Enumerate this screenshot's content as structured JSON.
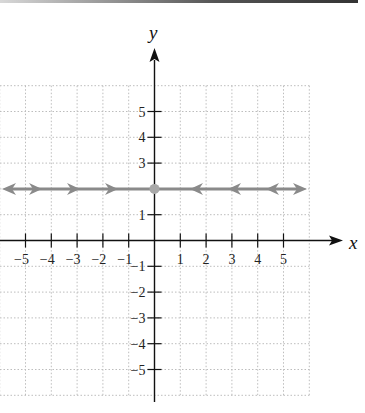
{
  "chart_data": {
    "type": "line",
    "title": "",
    "xlabel": "x",
    "ylabel": "y",
    "xlim": [
      -6,
      6
    ],
    "ylim": [
      -6,
      6
    ],
    "grid": true,
    "x_tick_labels": [
      "−5",
      "−4",
      "−3",
      "−2",
      "−1",
      "1",
      "2",
      "3",
      "4",
      "5"
    ],
    "x_ticks": [
      -5,
      -4,
      -3,
      -2,
      -1,
      1,
      2,
      3,
      4,
      5
    ],
    "y_tick_labels": [
      "5",
      "4",
      "3",
      "1",
      "−1",
      "−2",
      "−3",
      "−4",
      "−5"
    ],
    "y_ticks": [
      5,
      4,
      3,
      1,
      -1,
      -2,
      -3,
      -4,
      -5
    ],
    "series": [
      {
        "name": "y = 2",
        "equation": "y = 2",
        "kind": "horizontal line",
        "y": 2,
        "x": [
          -6,
          6
        ],
        "color": "#8a8a8a",
        "direction_arrows": "pointing toward (0, 2) from both sides",
        "end_arrows": "both ends"
      }
    ],
    "points": [
      {
        "x": 0,
        "y": 2,
        "color": "#a8a8a8",
        "label": ""
      }
    ]
  },
  "labels": {
    "x_axis": "x",
    "y_axis": "y"
  },
  "colors": {
    "axis": "#111111",
    "grid": "#bdbdbd",
    "line": "#8a8a8a",
    "point": "#a8a8a8"
  }
}
